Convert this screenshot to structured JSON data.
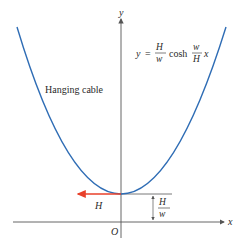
{
  "figure": {
    "title_label": "Hanging cable",
    "equation": {
      "lhs": "y",
      "equals": "=",
      "frac1_num": "H",
      "frac1_den": "w",
      "func": "cosh",
      "frac2_num": "w",
      "frac2_den": "H",
      "var": "x"
    },
    "axes": {
      "x_label": "x",
      "y_label": "y",
      "origin_label": "O"
    },
    "tension_label": "H",
    "height_label": {
      "num": "H",
      "den": "w"
    },
    "colors": {
      "curve": "#2f6db5",
      "tension_arrow": "#e8402a",
      "axes": "#555555",
      "text": "#2a2a2a"
    }
  }
}
